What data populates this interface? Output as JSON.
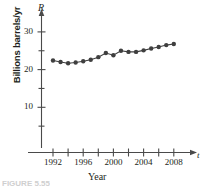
{
  "figure": {
    "caption": "FIGURE 5.55",
    "axis_name_y": "R",
    "axis_name_x": "t"
  },
  "chart_data": {
    "type": "line",
    "title": "",
    "subtitle": "",
    "xlabel": "Year",
    "ylabel": "Billions barrels/yr",
    "xlim": [
      1990.6,
      2009.8
    ],
    "ylim": [
      0,
      33
    ],
    "grid": false,
    "legend": null,
    "marker": "filled-circle",
    "color": "#3f3f3f",
    "x": [
      1992,
      1993,
      1994,
      1995,
      1996,
      1997,
      1998,
      1999,
      2000,
      2001,
      2002,
      2003,
      2004,
      2005,
      2006,
      2007,
      2008
    ],
    "values": [
      22.4,
      22.0,
      21.7,
      21.9,
      22.2,
      22.6,
      23.3,
      24.4,
      23.8,
      25.0,
      24.7,
      24.7,
      25.1,
      25.6,
      26.0,
      26.5,
      26.8
    ],
    "series": [
      {
        "name": "World oil production rate",
        "values": [
          22.4,
          22.0,
          21.7,
          21.9,
          22.2,
          22.6,
          23.3,
          24.4,
          23.8,
          25.0,
          24.7,
          24.7,
          25.1,
          25.6,
          26.0,
          26.5,
          26.8
        ]
      }
    ],
    "x_ticks": [
      1992,
      1994,
      1996,
      1998,
      2000,
      2002,
      2004,
      2006,
      2008
    ],
    "x_tick_labels": [
      "1992",
      "",
      "1996",
      "",
      "2000",
      "",
      "2004",
      "",
      "2008"
    ],
    "y_ticks": [
      5,
      10,
      15,
      20,
      25,
      30
    ],
    "y_tick_labels": [
      "",
      "10",
      "",
      "20",
      "",
      "30"
    ],
    "annotations": []
  }
}
